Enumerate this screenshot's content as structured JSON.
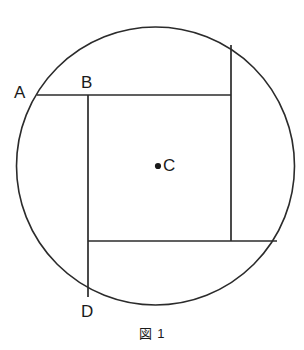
{
  "figure": {
    "caption": "図 1",
    "background_color": "#ffffff",
    "stroke_color": "#2b2b2b",
    "label_color": "#1a1a1a",
    "width": 304,
    "height": 350
  },
  "labels": {
    "a": "A",
    "b": "B",
    "c": "C",
    "d": "D"
  },
  "geometry": {
    "circle": {
      "name": "circle-outline",
      "cx": 155.5,
      "cy": 166,
      "r": 139
    },
    "center_point": {
      "name": "center-point-c",
      "cx": 158,
      "cy": 166,
      "r": 3.1
    },
    "chord_top": {
      "name": "chord-ab-horizontal",
      "x1": 37,
      "y1": 95,
      "x2": 231,
      "y2": 95
    },
    "chord_bottom": {
      "name": "chord-lower-horizontal",
      "x1": 88,
      "y1": 241,
      "x2": 277,
      "y2": 241
    },
    "chord_left_vertical": {
      "name": "chord-bd-vertical",
      "x1": 88,
      "y1": 95,
      "x2": 88,
      "y2": 297
    },
    "chord_right_vertical": {
      "name": "chord-right-vertical",
      "x1": 231,
      "y1": 45,
      "x2": 231,
      "y2": 241
    }
  }
}
